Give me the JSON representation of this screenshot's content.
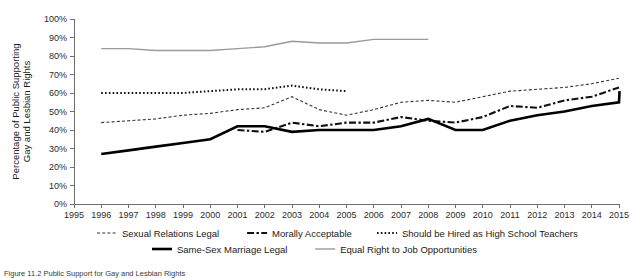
{
  "chart_data": {
    "type": "line",
    "title": "",
    "xlabel": "",
    "ylabel": "Percentage of Public Supporting Gay and Lesbian Rights",
    "ylim": [
      0,
      100
    ],
    "xlim": [
      1995,
      2015
    ],
    "grid": false,
    "legend_position": "bottom",
    "ytick_labels": [
      "0%",
      "10%",
      "20%",
      "30%",
      "40%",
      "50%",
      "60%",
      "70%",
      "80%",
      "90%",
      "100%"
    ],
    "ytick_values": [
      0,
      10,
      20,
      30,
      40,
      50,
      60,
      70,
      80,
      90,
      100
    ],
    "xtick_labels": [
      "1995",
      "1996",
      "1997",
      "1998",
      "1999",
      "2000",
      "2001",
      "2002",
      "2003",
      "2004",
      "2005",
      "2006",
      "2007",
      "2008",
      "2009",
      "2010",
      "2011",
      "2012",
      "2013",
      "2014",
      "2015"
    ],
    "x": [
      1995,
      1996,
      1997,
      1998,
      1999,
      2000,
      2001,
      2002,
      2003,
      2004,
      2005,
      2006,
      2007,
      2008,
      2009,
      2010,
      2011,
      2012,
      2013,
      2014,
      2015
    ],
    "series": [
      {
        "name": "Sexual Relations Legal",
        "style": "dashed-fine",
        "color": "#333333",
        "width": 1.1,
        "dasharray": "3,2.2",
        "points": [
          {
            "x": 1996,
            "y": 44
          },
          {
            "x": 1997,
            "y": 45
          },
          {
            "x": 1998,
            "y": 46
          },
          {
            "x": 1999,
            "y": 48
          },
          {
            "x": 2000,
            "y": 49
          },
          {
            "x": 2001,
            "y": 51
          },
          {
            "x": 2002,
            "y": 52
          },
          {
            "x": 2003,
            "y": 58
          },
          {
            "x": 2004,
            "y": 51
          },
          {
            "x": 2005,
            "y": 48
          },
          {
            "x": 2006,
            "y": 51
          },
          {
            "x": 2007,
            "y": 55
          },
          {
            "x": 2008,
            "y": 56
          },
          {
            "x": 2009,
            "y": 55
          },
          {
            "x": 2010,
            "y": 58
          },
          {
            "x": 2011,
            "y": 61
          },
          {
            "x": 2012,
            "y": 62
          },
          {
            "x": 2013,
            "y": 63
          },
          {
            "x": 2014,
            "y": 65
          },
          {
            "x": 2015,
            "y": 68
          }
        ]
      },
      {
        "name": "Morally Acceptable",
        "style": "dash-dot-heavy",
        "color": "#111111",
        "width": 2.1,
        "dasharray": "7,2.4,2.4,2.4",
        "points": [
          {
            "x": 2001,
            "y": 40
          },
          {
            "x": 2002,
            "y": 39
          },
          {
            "x": 2003,
            "y": 44
          },
          {
            "x": 2004,
            "y": 42
          },
          {
            "x": 2005,
            "y": 44
          },
          {
            "x": 2006,
            "y": 44
          },
          {
            "x": 2007,
            "y": 47
          },
          {
            "x": 2008,
            "y": 45
          },
          {
            "x": 2009,
            "y": 44
          },
          {
            "x": 2010,
            "y": 47
          },
          {
            "x": 2011,
            "y": 53
          },
          {
            "x": 2012,
            "y": 52
          },
          {
            "x": 2013,
            "y": 56
          },
          {
            "x": 2014,
            "y": 58
          },
          {
            "x": 2015,
            "y": 63
          }
        ]
      },
      {
        "name": "Should be Hired as High School Teachers",
        "style": "dotted",
        "color": "#111111",
        "width": 2.0,
        "dasharray": "1.6,2.2",
        "points": [
          {
            "x": 1996,
            "y": 60
          },
          {
            "x": 1997,
            "y": 60
          },
          {
            "x": 1998,
            "y": 60
          },
          {
            "x": 1999,
            "y": 60
          },
          {
            "x": 2000,
            "y": 61
          },
          {
            "x": 2001,
            "y": 62
          },
          {
            "x": 2002,
            "y": 62
          },
          {
            "x": 2003,
            "y": 64
          },
          {
            "x": 2004,
            "y": 62
          },
          {
            "x": 2005,
            "y": 61
          }
        ]
      },
      {
        "name": "Same-Sex Marriage Legal",
        "style": "solid-heavy",
        "color": "#000000",
        "width": 2.6,
        "dasharray": "",
        "points": [
          {
            "x": 1996,
            "y": 27
          },
          {
            "x": 1997,
            "y": 29
          },
          {
            "x": 1998,
            "y": 31
          },
          {
            "x": 1999,
            "y": 33
          },
          {
            "x": 2000,
            "y": 35
          },
          {
            "x": 2001,
            "y": 42
          },
          {
            "x": 2002,
            "y": 42
          },
          {
            "x": 2003,
            "y": 39
          },
          {
            "x": 2004,
            "y": 40
          },
          {
            "x": 2005,
            "y": 40
          },
          {
            "x": 2006,
            "y": 40
          },
          {
            "x": 2007,
            "y": 42
          },
          {
            "x": 2008,
            "y": 46
          },
          {
            "x": 2009,
            "y": 40
          },
          {
            "x": 2010,
            "y": 40
          },
          {
            "x": 2011,
            "y": 45
          },
          {
            "x": 2012,
            "y": 48
          },
          {
            "x": 2013,
            "y": 50
          },
          {
            "x": 2014,
            "y": 53
          },
          {
            "x": 2015,
            "y": 55
          },
          {
            "x": 2015.02,
            "y": 61
          }
        ]
      },
      {
        "name": "Equal Right to Job Opportunities",
        "style": "solid-light",
        "color": "#9a9a9a",
        "width": 1.4,
        "dasharray": "",
        "points": [
          {
            "x": 1996,
            "y": 84
          },
          {
            "x": 1997,
            "y": 84
          },
          {
            "x": 1998,
            "y": 83
          },
          {
            "x": 1999,
            "y": 83
          },
          {
            "x": 2000,
            "y": 83
          },
          {
            "x": 2001,
            "y": 84
          },
          {
            "x": 2002,
            "y": 85
          },
          {
            "x": 2003,
            "y": 88
          },
          {
            "x": 2004,
            "y": 87
          },
          {
            "x": 2005,
            "y": 87
          },
          {
            "x": 2006,
            "y": 89
          },
          {
            "x": 2007,
            "y": 89
          },
          {
            "x": 2008,
            "y": 89
          }
        ]
      }
    ]
  },
  "legend": {
    "row1": [
      {
        "label": "Sexual Relations Legal",
        "swatch": "dashed-fine"
      },
      {
        "label": "Morally Acceptable",
        "swatch": "dash-dot-heavy"
      },
      {
        "label": "Should be Hired as High School Teachers",
        "swatch": "dotted"
      }
    ],
    "row2": [
      {
        "label": "Same-Sex Marriage Legal",
        "swatch": "solid-heavy"
      },
      {
        "label": "Equal Right to Job Opportunities",
        "swatch": "solid-light"
      }
    ]
  },
  "caption": {
    "text": "Figure 11.2 Public Support for Gay and Lesbian Rights"
  }
}
